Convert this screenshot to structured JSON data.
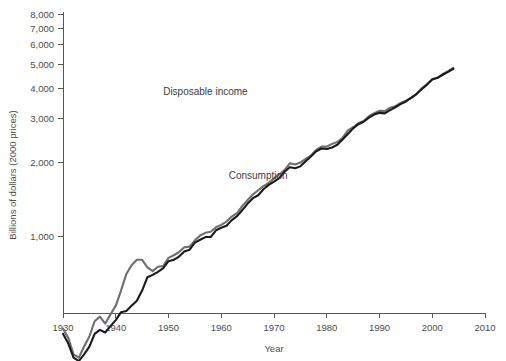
{
  "chart_data": {
    "type": "line",
    "title": "",
    "xlabel": "Year",
    "ylabel": "Billions of dollars (2000 prices)",
    "yscale": "log",
    "xlim": [
      1930,
      2010
    ],
    "ylim": [
      150,
      8000
    ],
    "grid": false,
    "legend_position": "inline-annotation",
    "x_ticks": [
      "1930",
      "1940",
      "1950",
      "1960",
      "1970",
      "1980",
      "1990",
      "2000",
      "2010"
    ],
    "x_tick_values": [
      1930,
      1940,
      1950,
      1960,
      1970,
      1980,
      1990,
      2000,
      2010
    ],
    "y_ticks": [
      "1,000",
      "2,000",
      "3,000",
      "4,000",
      "5,000",
      "6,000",
      "7,000",
      "8,000"
    ],
    "y_tick_values": [
      1000,
      2000,
      3000,
      4000,
      5000,
      6000,
      7000,
      8000
    ],
    "annotations": [
      {
        "text": "Disposable income",
        "x": 1957,
        "y": 3750
      },
      {
        "text": "Consumption",
        "x": 1967,
        "y": 1700
      }
    ],
    "colors": {
      "disposable_income": "#6e6e6e",
      "consumption": "#1a1a1a",
      "axis": "#585858",
      "text": "#4d4d4d",
      "background": "#ffffff"
    },
    "x": [
      1930,
      1931,
      1932,
      1933,
      1934,
      1935,
      1936,
      1937,
      1938,
      1939,
      1940,
      1941,
      1942,
      1943,
      1944,
      1945,
      1946,
      1947,
      1948,
      1949,
      1950,
      1951,
      1952,
      1953,
      1954,
      1955,
      1956,
      1957,
      1958,
      1959,
      1960,
      1961,
      1962,
      1963,
      1964,
      1965,
      1966,
      1967,
      1968,
      1969,
      1970,
      1971,
      1972,
      1973,
      1974,
      1975,
      1976,
      1977,
      1978,
      1979,
      1980,
      1981,
      1982,
      1983,
      1984,
      1985,
      1986,
      1987,
      1988,
      1989,
      1990,
      1991,
      1992,
      1993,
      1994,
      1995,
      1996,
      1997,
      1998,
      1999,
      2000,
      2001,
      2002,
      2003,
      2004
    ],
    "series": [
      {
        "name": "Disposable income",
        "color": "#6e6e6e",
        "values": [
          420,
          385,
          330,
          320,
          355,
          390,
          450,
          470,
          440,
          480,
          520,
          600,
          700,
          760,
          800,
          800,
          745,
          720,
          750,
          755,
          815,
          835,
          860,
          900,
          905,
          960,
          1005,
          1030,
          1040,
          1085,
          1110,
          1145,
          1200,
          1240,
          1325,
          1400,
          1475,
          1535,
          1595,
          1645,
          1715,
          1780,
          1855,
          1975,
          1955,
          1990,
          2060,
          2125,
          2240,
          2310,
          2310,
          2370,
          2410,
          2510,
          2690,
          2770,
          2875,
          2935,
          3070,
          3160,
          3230,
          3220,
          3325,
          3375,
          3475,
          3550,
          3650,
          3780,
          3985,
          4140,
          4340,
          4400,
          4560,
          4680,
          4830
        ]
      },
      {
        "name": "Consumption",
        "color": "#1a1a1a",
        "values": [
          400,
          365,
          320,
          310,
          330,
          355,
          400,
          415,
          405,
          430,
          455,
          490,
          495,
          520,
          545,
          600,
          680,
          695,
          715,
          740,
          790,
          800,
          825,
          865,
          880,
          940,
          965,
          990,
          990,
          1055,
          1080,
          1100,
          1160,
          1205,
          1275,
          1355,
          1425,
          1465,
          1550,
          1615,
          1665,
          1720,
          1825,
          1905,
          1885,
          1920,
          2015,
          2105,
          2210,
          2270,
          2260,
          2290,
          2350,
          2470,
          2600,
          2740,
          2850,
          2915,
          3030,
          3120,
          3170,
          3155,
          3250,
          3340,
          3440,
          3525,
          3645,
          3780,
          3955,
          4130,
          4330,
          4400,
          4530,
          4650,
          4790
        ]
      }
    ]
  }
}
